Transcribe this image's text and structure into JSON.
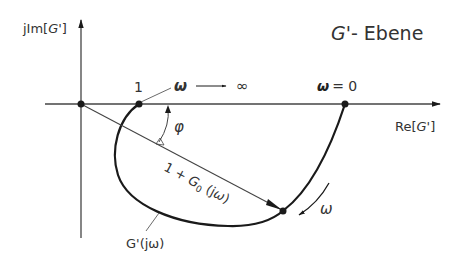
{
  "title": "G'- Ebene",
  "title_parts": {
    "symbol": "G'",
    "rest": "- Ebene"
  },
  "axes": {
    "y_label": "jIm[G']",
    "y_label_parts": {
      "pre": "jIm[",
      "sym": "G'",
      "post": "]"
    },
    "x_label": "Re[G']",
    "x_label_parts": {
      "pre": "Re[",
      "sym": "G'",
      "post": "]"
    }
  },
  "points": {
    "one_label": "1",
    "omega_inf_label": {
      "omega": "ω",
      "infinity": "∞"
    },
    "omega_zero_label": {
      "omega": "ω",
      "eq": "= 0"
    }
  },
  "annotations": {
    "phi": "φ",
    "vector_label": {
      "a": "1 + ",
      "g": "G",
      "sub": "0",
      "b": " (j",
      "w": "ω",
      "c": ")"
    },
    "vector_label_full": "1 + G0(jω)",
    "curve_label": "G'(jω)",
    "direction_omega": "ω"
  },
  "colors": {
    "line": "#1a1a1a",
    "thin_line": "#444444",
    "text": "#333333"
  }
}
